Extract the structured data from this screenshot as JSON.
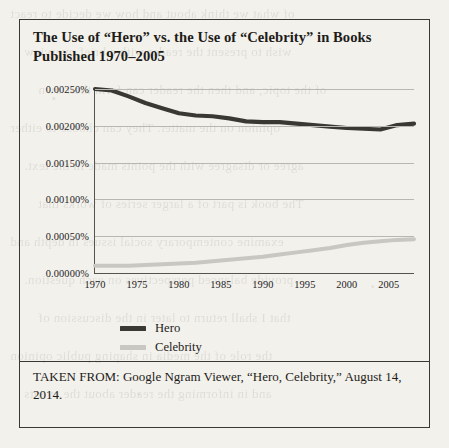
{
  "figure": {
    "title": "The Use of “Hero” vs. the Use of “Celebrity” in Books Published 1970–2005",
    "caption": "TAKEN FROM: Google Ngram Viewer, “Hero, Celebrity,” August 14, 2014."
  },
  "colors": {
    "hero": "#3a3833",
    "celebrity": "#c9c7c2",
    "axis": "#55534e",
    "grid": "#b9b7b1",
    "text": "#1d1c19",
    "page": "#f3f1ec",
    "border": "#3a3833"
  },
  "chart_data": {
    "type": "line",
    "title": "The Use of “Hero” vs. the Use of “Celebrity” in Books Published 1970–2005",
    "xlabel": "",
    "ylabel": "",
    "grid": true,
    "legend_position": "below-left",
    "xlim": [
      1970,
      2008
    ],
    "ylim": [
      0.0,
      0.0025
    ],
    "xticks": [
      1970,
      1975,
      1980,
      1985,
      1990,
      1995,
      2000,
      2005
    ],
    "xtick_labels": [
      "1970",
      "1975",
      "1980",
      "1985",
      "1990",
      "1995",
      "2000",
      "2005"
    ],
    "yticks": [
      0.0,
      0.0005,
      0.001,
      0.0015,
      0.002,
      0.0025
    ],
    "ytick_labels": [
      "0.00000%",
      "0.00050%",
      "0.00100%",
      "0.00150%",
      "0.00200%",
      "0.00250%"
    ],
    "x": [
      1970,
      1972,
      1974,
      1976,
      1978,
      1980,
      1982,
      1984,
      1986,
      1988,
      1990,
      1992,
      1994,
      1996,
      1998,
      2000,
      2002,
      2004,
      2006,
      2008
    ],
    "series": [
      {
        "name": "Hero",
        "color": "#3a3833",
        "values": [
          0.0025,
          0.00248,
          0.0024,
          0.00231,
          0.00224,
          0.00217,
          0.00214,
          0.00213,
          0.0021,
          0.00206,
          0.00205,
          0.00205,
          0.00203,
          0.00201,
          0.00199,
          0.00197,
          0.00196,
          0.00195,
          0.00201,
          0.00203
        ]
      },
      {
        "name": "Celebrity",
        "color": "#c9c7c2",
        "values": [
          0.0001,
          0.0001,
          0.0001,
          0.00011,
          0.00012,
          0.00013,
          0.00014,
          0.00016,
          0.00018,
          0.0002,
          0.00022,
          0.00025,
          0.00028,
          0.00031,
          0.00034,
          0.00038,
          0.00041,
          0.00043,
          0.00045,
          0.00046
        ]
      }
    ]
  },
  "legend": [
    {
      "label": "Hero",
      "color": "#3a3833"
    },
    {
      "label": "Celebrity",
      "color": "#c9c7c2"
    }
  ],
  "bleed_text": [
    "of what we think about and how we decide to react",
    "wish to present the reader with a brief overview",
    "of the topic, and then the reader can form their own",
    "opinion on the matter. They can choose to either",
    "agree or disagree with the points made in the text.",
    "The book is part of a larger series of works that",
    "examine contemporary social issues in depth and",
    "provide balanced perspectives on each question.",
    "that I shall return to later in the discussion of",
    "the role of the media in shaping public opinion",
    "and in informing the reader about the events"
  ]
}
